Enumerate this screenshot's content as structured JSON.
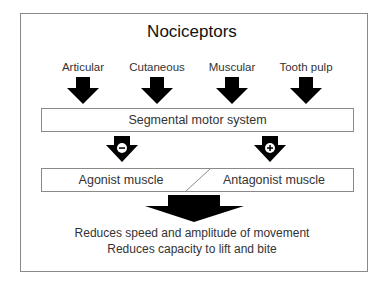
{
  "title": "Nociceptors",
  "sources": [
    {
      "label": "Articular",
      "x": 83
    },
    {
      "label": "Cutaneous",
      "x": 157
    },
    {
      "label": "Muscular",
      "x": 232
    },
    {
      "label": "Tooth pulp",
      "x": 306
    }
  ],
  "motor_system": {
    "label": "Segmental motor system"
  },
  "signals": [
    {
      "sign": "−",
      "meaning": "inhibition",
      "target": "Agonist muscle"
    },
    {
      "sign": "+",
      "meaning": "excitation",
      "target": "Antagonist muscle"
    }
  ],
  "muscles": {
    "agonist": "Agonist muscle",
    "antagonist": "Antagonist muscle"
  },
  "effects": [
    "Reduces speed and amplitude of movement",
    "Reduces capacity to lift and bite"
  ]
}
